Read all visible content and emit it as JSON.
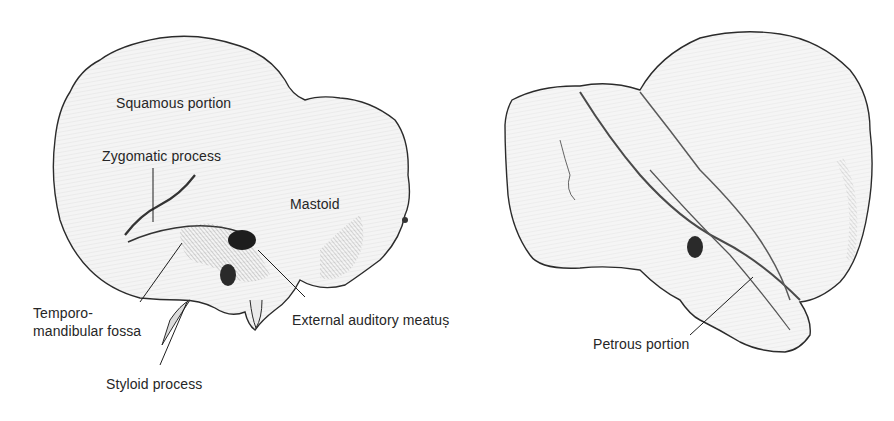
{
  "figure": {
    "lateral_view": {
      "labels": {
        "squamous": "Squamous portion",
        "zygomatic": "Zygomatic process",
        "mastoid": "Mastoid",
        "tmj_line1": "Temporo-",
        "tmj_line2": "mandibular fossa",
        "meatus": "External auditory meatuș",
        "styloid": "Styloid process"
      }
    },
    "medial_view": {
      "labels": {
        "petrous": "Petrous portion"
      }
    }
  }
}
